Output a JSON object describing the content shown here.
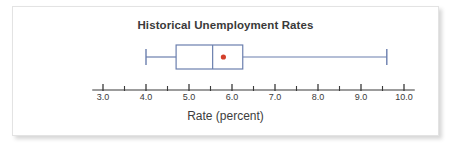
{
  "figure": {
    "title": "Historical Unemployment Rates",
    "axis_label": "Rate (percent)"
  },
  "colors": {
    "box_stroke": "#6b7fae",
    "whisker_stroke": "#6b7fae",
    "mean_marker": "#d3402c",
    "axis": "#3a3a3a",
    "text": "#3a3a3a",
    "card_border": "#e3e3e3",
    "background": "#ffffff"
  },
  "chart_data": {
    "type": "box",
    "title": "Historical Unemployment Rates",
    "xlabel": "Rate (percent)",
    "ylabel": "",
    "xlim": [
      2.75,
      10.25
    ],
    "grid": false,
    "legend": "none",
    "orientation": "horizontal",
    "major_ticks": [
      3.0,
      4.0,
      5.0,
      6.0,
      7.0,
      8.0,
      9.0,
      10.0
    ],
    "minor_ticks": [
      3.5,
      4.5,
      5.5,
      6.5,
      7.5,
      8.5,
      9.5
    ],
    "tick_labels": [
      "3.0",
      "4.0",
      "5.0",
      "6.0",
      "7.0",
      "8.0",
      "9.0",
      "10.0"
    ],
    "series": [
      {
        "name": "Historical Unemployment Rate",
        "min": 4.0,
        "q1": 4.7,
        "median": 5.55,
        "q3": 6.25,
        "max": 9.6,
        "mean": 5.8,
        "mean_marker": "red-dot"
      }
    ]
  }
}
